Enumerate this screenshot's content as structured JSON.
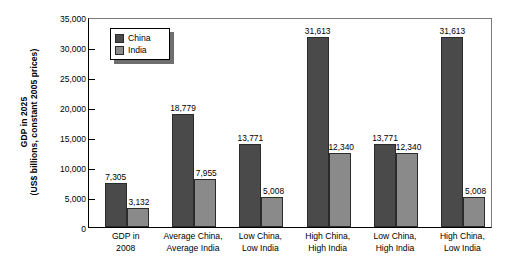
{
  "chart_data": {
    "type": "bar",
    "title": "",
    "xlabel": "",
    "ylabel_line1": "GDP in 2025",
    "ylabel_line2": "(US$ billions, constant 2005 prices)",
    "ylim": [
      0,
      35000
    ],
    "yticks": [
      "0",
      "5,000",
      "10,000",
      "15,000",
      "20,000",
      "25,000",
      "30,000",
      "35,000"
    ],
    "ytick_values": [
      0,
      5000,
      10000,
      15000,
      20000,
      25000,
      30000,
      35000
    ],
    "grid": false,
    "legend_position": "upper-left-inside",
    "categories": [
      "GDP in\n2008",
      "Average China,\nAverage India",
      "Low China,\nLow India",
      "High China,\nHigh India",
      "Low China,\nHigh India",
      "High China,\nLow India"
    ],
    "category_lines": [
      [
        "GDP in",
        "2008"
      ],
      [
        "Average China,",
        "Average India"
      ],
      [
        "Low China,",
        "Low India"
      ],
      [
        "High China,",
        "High India"
      ],
      [
        "Low China,",
        "High India"
      ],
      [
        "High China,",
        "Low India"
      ]
    ],
    "series": [
      {
        "name": "China",
        "color": "#4a4a4a",
        "values": [
          7305,
          18779,
          13771,
          31613,
          13771,
          31613
        ],
        "labels": [
          "7,305",
          "18,779",
          "13,771",
          "31,613",
          "13,771",
          "31,613"
        ]
      },
      {
        "name": "India",
        "color": "#8a8a8a",
        "values": [
          3132,
          7955,
          5008,
          12340,
          12340,
          5008
        ],
        "labels": [
          "3,132",
          "7,955",
          "5,008",
          "12,340",
          "12,340",
          "5,008"
        ]
      }
    ]
  }
}
